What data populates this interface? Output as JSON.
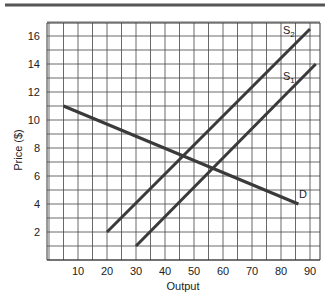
{
  "chart_data": {
    "type": "line",
    "title": "",
    "xlabel": "Output",
    "ylabel": "Price ($)",
    "xlim": [
      0,
      95
    ],
    "ylim": [
      0,
      17
    ],
    "xticks": [
      10,
      20,
      30,
      40,
      50,
      60,
      70,
      80,
      90
    ],
    "yticks": [
      2,
      4,
      6,
      8,
      10,
      12,
      14,
      16
    ],
    "grid": true,
    "series": [
      {
        "name": "S2",
        "label": "S₂",
        "x": [
          20,
          90
        ],
        "y": [
          2,
          16.5
        ]
      },
      {
        "name": "S1",
        "label": "S₁",
        "x": [
          30,
          92
        ],
        "y": [
          1,
          14
        ]
      },
      {
        "name": "D",
        "label": "D",
        "x": [
          5,
          86
        ],
        "y": [
          11,
          4
        ]
      }
    ]
  },
  "labels": {
    "xlabel": "Output",
    "ylabel": "Price ($)",
    "s2": "S",
    "s2_sub": "2",
    "s1": "S",
    "s1_sub": "1",
    "d": "D"
  },
  "xtick_labels": [
    "10",
    "20",
    "30",
    "40",
    "50",
    "60",
    "70",
    "80",
    "90"
  ],
  "ytick_labels": [
    "2",
    "4",
    "6",
    "8",
    "10",
    "12",
    "14",
    "16"
  ]
}
